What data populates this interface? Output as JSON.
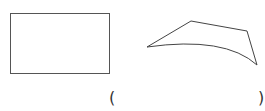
{
  "figure": {
    "stroke_color": "#555555",
    "shapes": [
      {
        "name": "rectangle",
        "type": "rect",
        "x": 10.5,
        "y": 13.5,
        "width": 99,
        "height": 60
      },
      {
        "name": "curved-quadrilateral",
        "type": "path",
        "points": [
          [
            147,
            47
          ],
          [
            191,
            21
          ],
          [
            247,
            31
          ],
          [
            257,
            65
          ]
        ],
        "curve_control": [
          205,
          34
        ]
      }
    ]
  },
  "answer_blank": {
    "open": "(",
    "close": ")"
  }
}
